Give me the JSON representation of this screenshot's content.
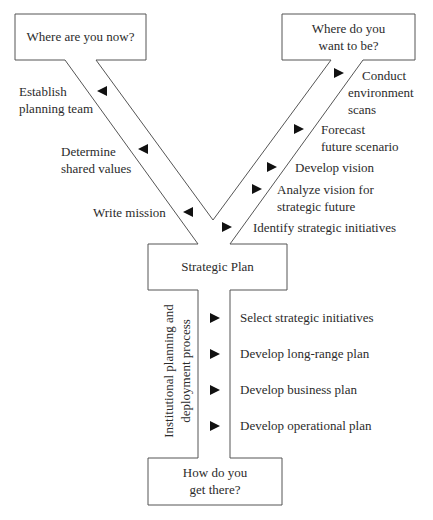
{
  "diagram": {
    "type": "Y-shaped strategic planning flow diagram",
    "boxes": {
      "top_left": {
        "label": "Where are you now?"
      },
      "top_right": {
        "line1": "Where do you",
        "line2": "want to be?"
      },
      "center": {
        "label": "Strategic Plan"
      },
      "bottom": {
        "line1": "How do you",
        "line2": "get there?"
      }
    },
    "left_branch_steps": [
      {
        "line1": "Establish",
        "line2": "planning team",
        "arrow": "left"
      },
      {
        "line1": "Determine",
        "line2": "shared values",
        "arrow": "left"
      },
      {
        "line1": "Write mission",
        "line2": "",
        "arrow": "left"
      }
    ],
    "right_branch_steps": [
      {
        "line1": "Conduct",
        "line2": "environment",
        "line3": "scans",
        "arrow": "right"
      },
      {
        "line1": "Forecast",
        "line2": "future scenario",
        "arrow": "right"
      },
      {
        "line1": "Develop vision",
        "arrow": "right"
      },
      {
        "line1": "Analyze vision for",
        "line2": "strategic future",
        "arrow": "right"
      },
      {
        "line1": "Identify strategic initiatives",
        "arrow": "right"
      }
    ],
    "stem": {
      "side_label_line1": "Institutional planning and",
      "side_label_line2": "deployment process",
      "steps": [
        {
          "label": "Select strategic initiatives",
          "arrow": "right"
        },
        {
          "label": "Develop long-range plan",
          "arrow": "right"
        },
        {
          "label": "Develop business plan",
          "arrow": "right"
        },
        {
          "label": "Develop operational plan",
          "arrow": "right"
        }
      ]
    },
    "colors": {
      "line": "#555555",
      "arrow": "#111111",
      "text": "#2b2b2b",
      "background": "#ffffff"
    }
  }
}
